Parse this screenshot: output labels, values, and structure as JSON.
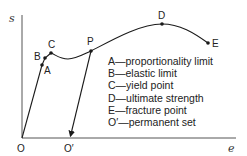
{
  "diagram": {
    "title": "",
    "y_axis_label": "s",
    "x_axis_label": "e",
    "origin_label": "O",
    "unload_point_label": "O′",
    "points": {
      "A": "A",
      "B": "B",
      "C": "C",
      "P": "P",
      "D": "D",
      "E": "E"
    },
    "legend": [
      "A—proportionality limit",
      "B—elastic limit",
      "C—yield point",
      "D—ultimate strength",
      "E—fracture point",
      "O′—permanent set"
    ],
    "colors": {
      "line": "#1a1a1a",
      "axis": "#555555",
      "text": "#222222"
    }
  }
}
